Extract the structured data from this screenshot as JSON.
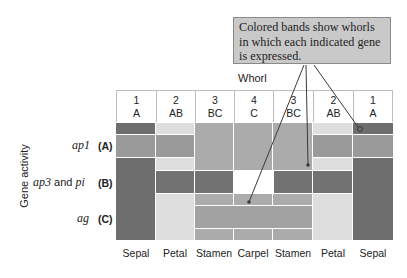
{
  "callout": {
    "lines": [
      "Colored bands show whorls",
      "in which each indicated gene",
      "is expressed."
    ]
  },
  "axis": {
    "column_title": "Whorl",
    "row_title": "Gene activity"
  },
  "columns": [
    {
      "whorl": "1",
      "genes": "A",
      "organ": "Sepal"
    },
    {
      "whorl": "2",
      "genes": "AB",
      "organ": "Petal"
    },
    {
      "whorl": "3",
      "genes": "BC",
      "organ": "Stamen"
    },
    {
      "whorl": "4",
      "genes": "C",
      "organ": "Carpel"
    },
    {
      "whorl": "3",
      "genes": "BC",
      "organ": "Stamen"
    },
    {
      "whorl": "2",
      "genes": "AB",
      "organ": "Petal"
    },
    {
      "whorl": "1",
      "genes": "A",
      "organ": "Sepal"
    }
  ],
  "rows": [
    {
      "gene": "ap1",
      "connector": "",
      "gene2": "",
      "class": "(A)",
      "expressed_in_columns": [
        1,
        2,
        6,
        7
      ]
    },
    {
      "gene": "ap3",
      "connector": "and",
      "gene2": "pi",
      "class": "(B)",
      "expressed_in_columns": [
        2,
        3,
        5,
        6
      ]
    },
    {
      "gene": "ag",
      "connector": "",
      "gene2": "",
      "class": "(C)",
      "expressed_in_columns": [
        3,
        4,
        5
      ]
    }
  ],
  "colors": {
    "sepal": "#6e6e6e",
    "petal": "#dedede",
    "stamen_carpel": "#ababab",
    "band_a": "#9a9a9a",
    "band_b": "#727272",
    "band_c": "#a2a2a2",
    "callout_fill": "#c9c9c9"
  }
}
